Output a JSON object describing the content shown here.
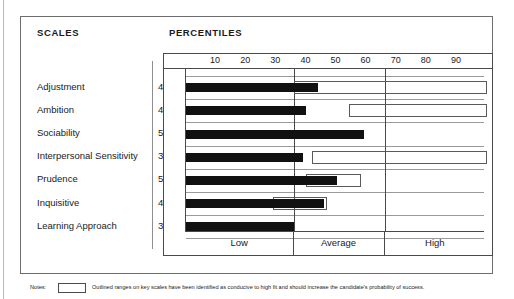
{
  "header": {
    "scales_title": "SCALES",
    "percentiles_title": "PERCENTILES"
  },
  "notes": {
    "label": "Notes:",
    "text": "Outlined ranges on key scales have been identified as conducive to high fit and should increase the candidate's probability of success."
  },
  "chart_data": {
    "type": "bar",
    "title": "PERCENTILES",
    "orientation": "horizontal",
    "xlabel": "",
    "ylabel": "",
    "xlim": [
      0,
      100
    ],
    "grid": true,
    "tick_labels": [
      "10",
      "20",
      "30",
      "40",
      "50",
      "60",
      "70",
      "80",
      "90"
    ],
    "ticks": [
      10,
      20,
      30,
      40,
      50,
      60,
      70,
      80,
      90
    ],
    "band_labels": [
      "Low",
      "Average",
      "High"
    ],
    "band_boundaries": [
      36,
      66
    ],
    "categories": [
      "Adjustment",
      "Ambition",
      "Sociability",
      "Interpersonal Sensitivity",
      "Prudence",
      "Inquisitive",
      "Learning Approach"
    ],
    "values": [
      44,
      40,
      59,
      39,
      50,
      46,
      36
    ],
    "score_labels": [
      "44",
      "40",
      "59",
      "39",
      "50",
      "46",
      "36"
    ],
    "outlined_ranges": [
      {
        "category": "Adjustment",
        "start": 36,
        "end": 100
      },
      {
        "category": "Ambition",
        "start": 54,
        "end": 100
      },
      {
        "category": "Sociability",
        "start": null,
        "end": null
      },
      {
        "category": "Interpersonal Sensitivity",
        "start": 42,
        "end": 100
      },
      {
        "category": "Prudence",
        "start": 40,
        "end": 58
      },
      {
        "category": "Inquisitive",
        "start": 29,
        "end": 47
      },
      {
        "category": "Learning Approach",
        "start": null,
        "end": null
      }
    ]
  },
  "colors": {
    "bar": "#111111",
    "frame": "#4a4a4a",
    "grid": "#9a9a9a"
  }
}
